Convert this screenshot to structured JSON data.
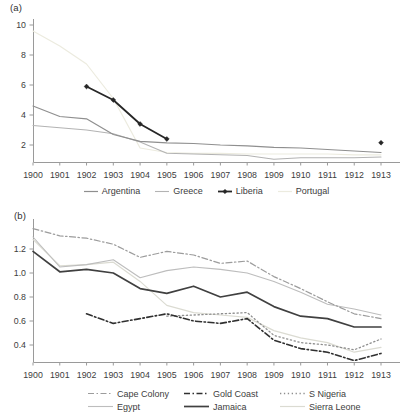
{
  "page": {
    "background": "#ffffff",
    "text_color": "#3d3d3d",
    "axis_color": "#9a9a9a"
  },
  "chart_data": [
    {
      "id": "a",
      "type": "line",
      "title": "(a)",
      "x": [
        "1900",
        "1901",
        "1902",
        "1903",
        "1904",
        "1905",
        "1906",
        "1907",
        "1908",
        "1909",
        "1910",
        "1911",
        "1912",
        "1913"
      ],
      "xlabel": "",
      "ylabel": "",
      "ylim": [
        0.9,
        10.3
      ],
      "grid": false,
      "legend_position": "bottom",
      "yticks": [
        {
          "v": 2,
          "label": "2"
        },
        {
          "v": 4,
          "label": "4"
        },
        {
          "v": 6,
          "label": "6"
        },
        {
          "v": 8,
          "label": "8"
        },
        {
          "v": 10,
          "label": "10"
        }
      ],
      "legend_order": [
        "Argentina",
        "Greece",
        "Liberia",
        "Portugal"
      ],
      "series": [
        {
          "name": "Portugal",
          "color": "#ecebdf",
          "style": "solid",
          "width": 1.2,
          "values": [
            9.6,
            8.6,
            7.4,
            5.1,
            1.8,
            1.5,
            1.45,
            1.45,
            1.4,
            1.4,
            1.4,
            1.4,
            1.35,
            1.35
          ]
        },
        {
          "name": "Greece",
          "color": "#b3b3b3",
          "style": "solid",
          "width": 1.1,
          "values": [
            3.3,
            3.15,
            3.0,
            2.75,
            2.2,
            1.45,
            1.4,
            1.35,
            1.3,
            1.05,
            1.15,
            1.15,
            1.15,
            1.2
          ]
        },
        {
          "name": "Argentina",
          "color": "#8f8f8f",
          "style": "solid",
          "width": 1.2,
          "values": [
            4.6,
            3.9,
            3.75,
            2.7,
            2.25,
            2.15,
            2.1,
            2.0,
            1.95,
            1.85,
            1.8,
            1.7,
            1.6,
            1.5
          ]
        },
        {
          "name": "Liberia",
          "color": "#262626",
          "style": "solid",
          "width": 1.8,
          "marker": "diamond",
          "values": [
            null,
            null,
            5.9,
            5.0,
            3.4,
            2.4,
            null,
            null,
            null,
            null,
            null,
            null,
            null,
            2.15
          ]
        }
      ]
    },
    {
      "id": "b",
      "type": "line",
      "title": "(b)",
      "x": [
        "1900",
        "1901",
        "1902",
        "1903",
        "1904",
        "1905",
        "1906",
        "1907",
        "1908",
        "1909",
        "1910",
        "1911",
        "1912",
        "1913"
      ],
      "xlabel": "",
      "ylabel": "",
      "ylim": [
        0.26,
        1.45
      ],
      "grid": false,
      "legend_position": "bottom",
      "yticks": [
        {
          "v": 0.4,
          "label": "0.4"
        },
        {
          "v": 0.6,
          "label": "0.6"
        },
        {
          "v": 0.8,
          "label": "0.8"
        },
        {
          "v": 1.0,
          "label": "1.0"
        },
        {
          "v": 1.2,
          "label": "1.2"
        }
      ],
      "legend_rows": [
        [
          "Cape Colony",
          "Gold Coast",
          "S Nigeria"
        ],
        [
          "Egypt",
          "Jamaica",
          "Sierra Leone"
        ]
      ],
      "series": [
        {
          "name": "Sierra Leone",
          "color": "#dbdbd2",
          "style": "solid",
          "width": 1.2,
          "values": [
            1.28,
            1.06,
            1.07,
            1.09,
            0.93,
            0.73,
            0.67,
            0.65,
            0.63,
            0.52,
            0.46,
            0.42,
            0.34,
            0.38
          ]
        },
        {
          "name": "Egypt",
          "color": "#bdbdbd",
          "style": "solid",
          "width": 1.1,
          "values": [
            1.3,
            1.05,
            1.07,
            1.11,
            0.96,
            1.02,
            1.05,
            1.03,
            1.0,
            0.93,
            0.84,
            0.74,
            0.7,
            0.65
          ]
        },
        {
          "name": "Cape Colony",
          "color": "#9c9c9c",
          "style": "dashdot",
          "width": 1.2,
          "values": [
            1.37,
            1.31,
            1.29,
            1.24,
            1.13,
            1.18,
            1.15,
            1.08,
            1.1,
            0.97,
            0.87,
            0.76,
            0.66,
            0.62
          ]
        },
        {
          "name": "S Nigeria",
          "color": "#8e8e8e",
          "style": "dotted",
          "width": 1.3,
          "values": [
            null,
            null,
            null,
            null,
            null,
            0.64,
            0.65,
            0.66,
            0.67,
            0.48,
            0.42,
            0.4,
            0.36,
            0.45
          ]
        },
        {
          "name": "Gold Coast",
          "color": "#303030",
          "style": "dashdot",
          "width": 1.6,
          "values": [
            null,
            null,
            0.66,
            0.58,
            0.62,
            0.66,
            0.6,
            0.58,
            0.62,
            0.44,
            0.37,
            0.34,
            0.27,
            0.33
          ]
        },
        {
          "name": "Jamaica",
          "color": "#404040",
          "style": "solid",
          "width": 1.7,
          "values": [
            1.18,
            1.01,
            1.03,
            1.0,
            0.87,
            0.83,
            0.89,
            0.8,
            0.84,
            0.72,
            0.64,
            0.62,
            0.55,
            0.55
          ]
        }
      ]
    }
  ]
}
